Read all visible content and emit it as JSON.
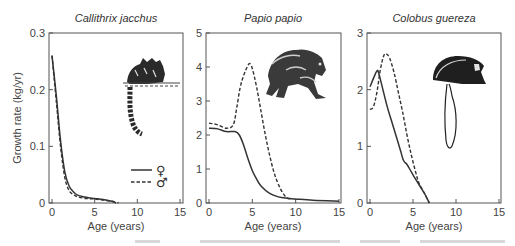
{
  "figure": {
    "ylabel": "Growth rate (kg/yr)",
    "legend": [
      {
        "label": "♀",
        "style": "solid",
        "meaning": "female"
      },
      {
        "label": "♂",
        "style": "dashed",
        "meaning": "male"
      }
    ]
  },
  "chart_data": [
    {
      "type": "line",
      "title": "Callithrix jacchus",
      "xlabel": "Age (years)",
      "ylabel": "Growth rate (kg/yr)",
      "xlim": [
        0,
        15
      ],
      "ylim": [
        0,
        0.3
      ],
      "xticks": [
        0,
        5,
        10,
        15
      ],
      "yticks": [
        0,
        0.1,
        0.2,
        0.3
      ],
      "ytick_labels": [
        "0",
        "0.1",
        "0.2",
        "0.3"
      ],
      "grid": false,
      "legend_position": "lower right",
      "series": [
        {
          "name": "♀",
          "style": "solid",
          "x": [
            0,
            0.5,
            1.0,
            1.5,
            2.0,
            2.5,
            3.0,
            4.0,
            5.0,
            6.0,
            7.0,
            7.5
          ],
          "y": [
            0.26,
            0.19,
            0.11,
            0.055,
            0.03,
            0.02,
            0.014,
            0.01,
            0.008,
            0.006,
            0.003,
            0.0
          ]
        },
        {
          "name": "♂",
          "style": "dashed",
          "x": [
            0,
            0.5,
            1.0,
            1.5,
            2.0,
            2.5,
            3.0,
            4.0,
            5.0,
            6.0,
            7.0,
            7.8
          ],
          "y": [
            0.26,
            0.18,
            0.1,
            0.045,
            0.022,
            0.015,
            0.011,
            0.008,
            0.007,
            0.005,
            0.003,
            0.0
          ]
        }
      ]
    },
    {
      "type": "line",
      "title": "Papio papio",
      "xlabel": "Age (years)",
      "xlim": [
        0,
        15
      ],
      "ylim": [
        0,
        5
      ],
      "xticks": [
        0,
        5,
        10,
        15
      ],
      "yticks": [
        0,
        1,
        2,
        3,
        4,
        5
      ],
      "ytick_labels": [
        "0",
        "1",
        "2",
        "3",
        "4",
        "5"
      ],
      "grid": false,
      "series": [
        {
          "name": "♀",
          "style": "solid",
          "x": [
            0,
            1,
            2,
            3,
            3.5,
            4,
            4.5,
            5,
            5.5,
            6,
            7,
            8,
            9,
            10,
            12,
            15
          ],
          "y": [
            2.2,
            2.18,
            2.1,
            2.1,
            2.0,
            1.7,
            1.3,
            0.95,
            0.7,
            0.5,
            0.28,
            0.18,
            0.14,
            0.12,
            0.08,
            0.05
          ]
        },
        {
          "name": "♂",
          "style": "dashed",
          "x": [
            0,
            1,
            2,
            2.8,
            3.2,
            3.6,
            4.0,
            4.4,
            4.7,
            5.0,
            5.5,
            6.0,
            6.5,
            7.0,
            7.5,
            8.0,
            8.5,
            9.0,
            9.5
          ],
          "y": [
            2.35,
            2.3,
            2.2,
            2.3,
            2.8,
            3.4,
            3.75,
            4.0,
            4.1,
            3.95,
            3.4,
            2.7,
            2.0,
            1.4,
            0.9,
            0.55,
            0.3,
            0.15,
            0.12
          ]
        }
      ]
    },
    {
      "type": "line",
      "title": "Colobus guereza",
      "xlabel": "Age (years)",
      "xlim": [
        0,
        15
      ],
      "ylim": [
        0,
        3
      ],
      "xticks": [
        0,
        5,
        10,
        15
      ],
      "yticks": [
        0,
        1,
        2,
        3
      ],
      "ytick_labels": [
        "0",
        "1",
        "2",
        "3"
      ],
      "grid": false,
      "series": [
        {
          "name": "♀",
          "style": "solid",
          "x": [
            0,
            0.4,
            0.8,
            1.0,
            1.5,
            2.0,
            2.5,
            3.0,
            3.5,
            3.9,
            4.3,
            4.8,
            5.3,
            5.8,
            6.4,
            6.9
          ],
          "y": [
            2.05,
            2.2,
            2.33,
            2.3,
            2.0,
            1.7,
            1.45,
            1.2,
            0.95,
            0.75,
            0.68,
            0.55,
            0.42,
            0.3,
            0.15,
            0.0
          ]
        },
        {
          "name": "♂",
          "style": "dashed",
          "x": [
            0,
            0.4,
            0.8,
            1.2,
            1.6,
            1.9,
            2.3,
            2.8,
            3.3,
            3.8,
            4.3,
            4.8,
            5.3,
            5.7,
            6.3,
            6.9
          ],
          "y": [
            1.65,
            1.7,
            1.95,
            2.35,
            2.6,
            2.63,
            2.55,
            2.3,
            1.95,
            1.6,
            1.2,
            0.85,
            0.55,
            0.35,
            0.18,
            0.0
          ]
        }
      ]
    }
  ]
}
